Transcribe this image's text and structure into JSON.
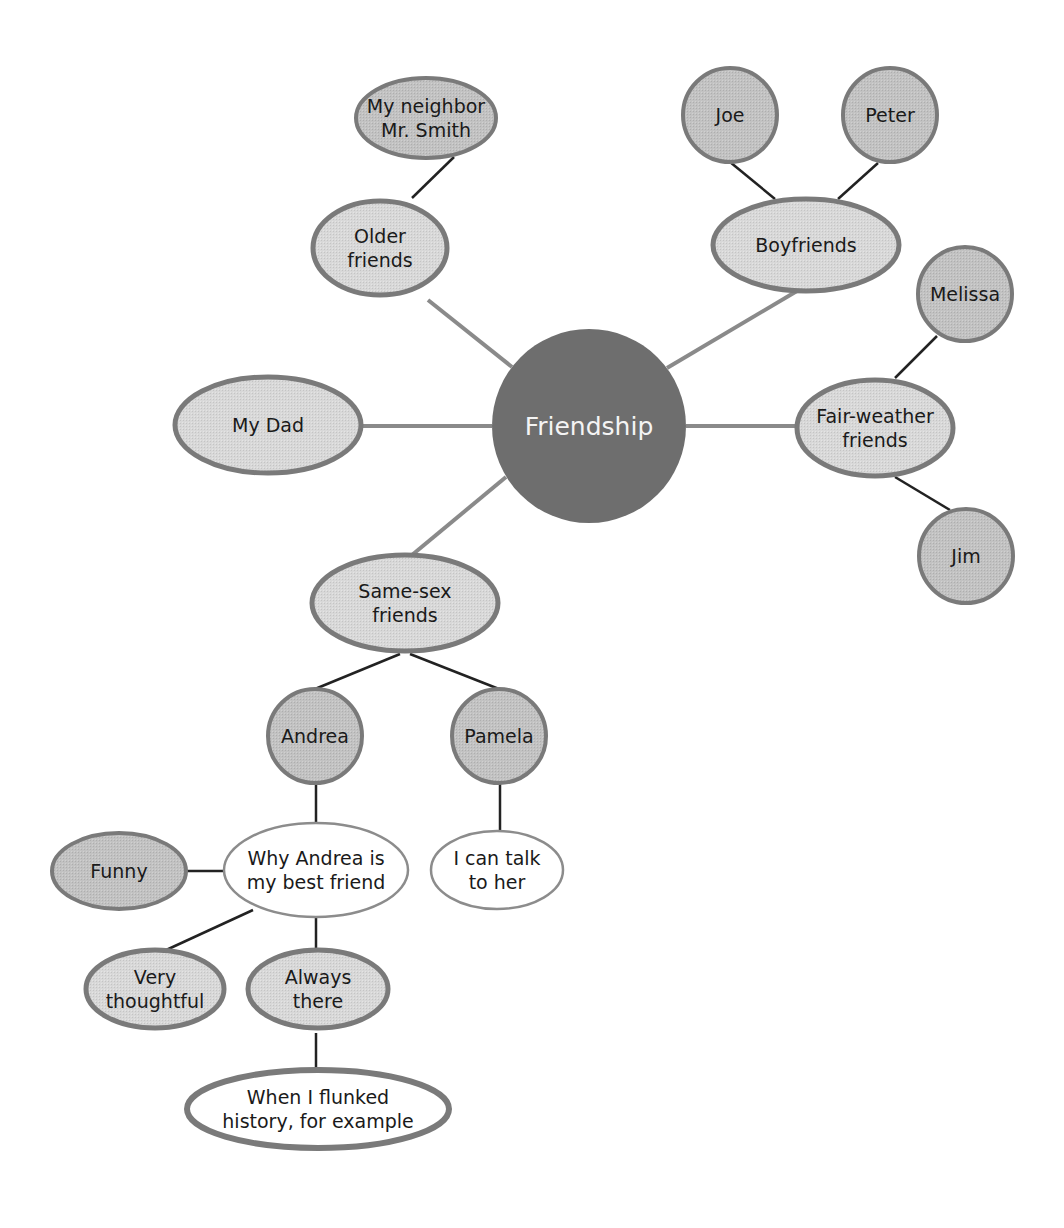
{
  "title": "Friendship",
  "colors": {
    "center_fill": "#6e6e6e",
    "node_fill": "#d6d6d6",
    "node_fill_dark": "#bfbfbf",
    "node_stroke": "#7a7a7a",
    "white_fill": "#ffffff",
    "line_gray": "#8a8a8a",
    "line_dark": "#222222"
  },
  "center": {
    "id": "friendship",
    "label": "Friendship",
    "cx": 589,
    "cy": 426,
    "r": 97
  },
  "nodes": [
    {
      "id": "older-friends",
      "lines": [
        "Older",
        "friends"
      ],
      "shape": "ellipse",
      "cx": 380,
      "cy": 248,
      "rx": 67,
      "ry": 47,
      "style": "light"
    },
    {
      "id": "my-neighbor-mr-smith",
      "lines": [
        "My neighbor",
        "Mr. Smith"
      ],
      "shape": "ellipse",
      "cx": 426,
      "cy": 118,
      "rx": 70,
      "ry": 40,
      "style": "dark"
    },
    {
      "id": "boyfriends",
      "lines": [
        "Boyfriends"
      ],
      "shape": "ellipse",
      "cx": 806,
      "cy": 245,
      "rx": 93,
      "ry": 46,
      "style": "light"
    },
    {
      "id": "joe",
      "lines": [
        "Joe"
      ],
      "shape": "circle",
      "cx": 730,
      "cy": 115,
      "r": 47,
      "style": "dark"
    },
    {
      "id": "peter",
      "lines": [
        "Peter"
      ],
      "shape": "circle",
      "cx": 890,
      "cy": 115,
      "r": 47,
      "style": "dark"
    },
    {
      "id": "my-dad",
      "lines": [
        "My Dad"
      ],
      "shape": "ellipse",
      "cx": 268,
      "cy": 425,
      "rx": 93,
      "ry": 48,
      "style": "light"
    },
    {
      "id": "fair-weather-friends",
      "lines": [
        "Fair-weather",
        "friends"
      ],
      "shape": "ellipse",
      "cx": 875,
      "cy": 428,
      "rx": 78,
      "ry": 48,
      "style": "light"
    },
    {
      "id": "melissa",
      "lines": [
        "Melissa"
      ],
      "shape": "circle",
      "cx": 965,
      "cy": 294,
      "r": 47,
      "style": "dark"
    },
    {
      "id": "jim",
      "lines": [
        "Jim"
      ],
      "shape": "circle",
      "cx": 966,
      "cy": 556,
      "r": 47,
      "style": "dark"
    },
    {
      "id": "same-sex-friends",
      "lines": [
        "Same-sex",
        "friends"
      ],
      "shape": "ellipse",
      "cx": 405,
      "cy": 603,
      "rx": 93,
      "ry": 48,
      "style": "light"
    },
    {
      "id": "andrea",
      "lines": [
        "Andrea"
      ],
      "shape": "circle",
      "cx": 315,
      "cy": 736,
      "r": 47,
      "style": "dark"
    },
    {
      "id": "pamela",
      "lines": [
        "Pamela"
      ],
      "shape": "circle",
      "cx": 499,
      "cy": 736,
      "r": 47,
      "style": "dark"
    },
    {
      "id": "why-andrea",
      "lines": [
        "Why Andrea is",
        "my best friend"
      ],
      "shape": "ellipse",
      "cx": 316,
      "cy": 870,
      "rx": 92,
      "ry": 47,
      "style": "white"
    },
    {
      "id": "i-can-talk-to-her",
      "lines": [
        "I can talk",
        "to her"
      ],
      "shape": "ellipse",
      "cx": 497,
      "cy": 870,
      "rx": 66,
      "ry": 39,
      "style": "white"
    },
    {
      "id": "funny",
      "lines": [
        "Funny"
      ],
      "shape": "ellipse",
      "cx": 119,
      "cy": 871,
      "rx": 67,
      "ry": 38,
      "style": "dark"
    },
    {
      "id": "very-thoughtful",
      "lines": [
        "Very",
        "thoughtful"
      ],
      "shape": "ellipse",
      "cx": 155,
      "cy": 989,
      "rx": 69,
      "ry": 39,
      "style": "light"
    },
    {
      "id": "always-there",
      "lines": [
        "Always",
        "there"
      ],
      "shape": "ellipse",
      "cx": 318,
      "cy": 989,
      "rx": 70,
      "ry": 39,
      "style": "light"
    },
    {
      "id": "when-i-flunked",
      "lines": [
        "When I flunked",
        "history, for example"
      ],
      "shape": "ellipse",
      "cx": 318,
      "cy": 1109,
      "rx": 131,
      "ry": 39,
      "style": "white-thick"
    }
  ],
  "edges": [
    {
      "from": "friendship",
      "to": "older-friends",
      "x1": 512,
      "y1": 367,
      "x2": 428,
      "y2": 300,
      "style": "gray"
    },
    {
      "from": "my-neighbor-mr-smith",
      "to": "older-friends",
      "x1": 454,
      "y1": 157,
      "x2": 412,
      "y2": 198,
      "style": "dark"
    },
    {
      "from": "friendship",
      "to": "boyfriends",
      "x1": 667,
      "y1": 368,
      "x2": 797,
      "y2": 291,
      "style": "gray"
    },
    {
      "from": "joe",
      "to": "boyfriends",
      "x1": 730,
      "y1": 162,
      "x2": 775,
      "y2": 199,
      "style": "dark"
    },
    {
      "from": "peter",
      "to": "boyfriends",
      "x1": 878,
      "y1": 163,
      "x2": 838,
      "y2": 199,
      "style": "dark"
    },
    {
      "from": "friendship",
      "to": "my-dad",
      "x1": 492,
      "y1": 426,
      "x2": 361,
      "y2": 426,
      "style": "gray"
    },
    {
      "from": "friendship",
      "to": "fair-weather-friends",
      "x1": 686,
      "y1": 426,
      "x2": 797,
      "y2": 426,
      "style": "gray"
    },
    {
      "from": "melissa",
      "to": "fair-weather-friends",
      "x1": 937,
      "y1": 336,
      "x2": 895,
      "y2": 378,
      "style": "dark"
    },
    {
      "from": "fair-weather-friends",
      "to": "jim",
      "x1": 895,
      "y1": 477,
      "x2": 950,
      "y2": 510,
      "style": "dark"
    },
    {
      "from": "friendship",
      "to": "same-sex-friends",
      "x1": 506,
      "y1": 477,
      "x2": 412,
      "y2": 555,
      "style": "gray"
    },
    {
      "from": "same-sex-friends",
      "to": "andrea",
      "x1": 400,
      "y1": 654,
      "x2": 315,
      "y2": 689,
      "style": "dark"
    },
    {
      "from": "same-sex-friends",
      "to": "pamela",
      "x1": 410,
      "y1": 654,
      "x2": 499,
      "y2": 689,
      "style": "dark"
    },
    {
      "from": "andrea",
      "to": "why-andrea",
      "x1": 316,
      "y1": 783,
      "x2": 316,
      "y2": 823,
      "style": "dark"
    },
    {
      "from": "pamela",
      "to": "i-can-talk-to-her",
      "x1": 500,
      "y1": 783,
      "x2": 500,
      "y2": 831,
      "style": "dark"
    },
    {
      "from": "funny",
      "to": "why-andrea",
      "x1": 186,
      "y1": 871,
      "x2": 224,
      "y2": 871,
      "style": "dark"
    },
    {
      "from": "why-andrea",
      "to": "very-thoughtful",
      "x1": 253,
      "y1": 910,
      "x2": 164,
      "y2": 951,
      "style": "dark"
    },
    {
      "from": "why-andrea",
      "to": "always-there",
      "x1": 316,
      "y1": 917,
      "x2": 316,
      "y2": 951,
      "style": "dark"
    },
    {
      "from": "always-there",
      "to": "when-i-flunked",
      "x1": 316,
      "y1": 1033,
      "x2": 316,
      "y2": 1070,
      "style": "dark"
    }
  ]
}
